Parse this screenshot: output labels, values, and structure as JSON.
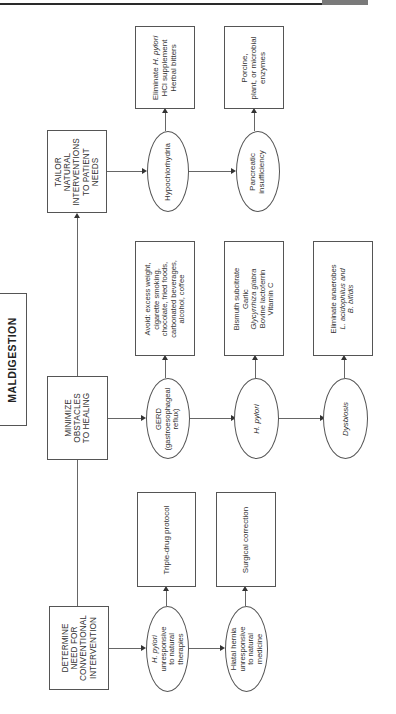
{
  "header": {
    "rule": true
  },
  "title": "MALDIGESTION",
  "steps": [
    {
      "label_lines": [
        "TAILOR",
        "NATURAL",
        "INTERVENTIONS",
        "TO PATIENT",
        "NEEDS"
      ],
      "conditions": [
        {
          "label_lines": [
            "Hypochlorhydria"
          ],
          "treatment_lines": [
            "Eliminate H. pylori",
            "HCl supplement",
            "Herbal bitters"
          ]
        },
        {
          "label_lines": [
            "Pancreatic",
            "insufficiency"
          ],
          "treatment_lines": [
            "Porcine,",
            "plant, or microbial",
            "enzymes"
          ]
        }
      ]
    },
    {
      "label_lines": [
        "MINIMIZE",
        "OBSTACLES",
        "TO HEALING"
      ],
      "conditions": [
        {
          "label_lines": [
            "GERD",
            "(gastroesophageal",
            "reflux)"
          ],
          "treatment_lines": [
            "Avoid: excess weight,",
            "cigarette smoking,",
            "chocolate, fried foods,",
            "carbonated beverages,",
            "alcohol, coffee"
          ]
        },
        {
          "label_lines": [
            "H. pylori"
          ],
          "treatment_lines": [
            "Bismuth subcitrate",
            "Garlic",
            "Glycyrrhiza glabra",
            "Bovine lactoferrin",
            "Vitamin C"
          ]
        },
        {
          "label_lines": [
            "Dysbiosis"
          ],
          "treatment_lines": [
            "Eliminate anaerobes",
            "L. acidophilus and",
            "B. bifidis"
          ]
        }
      ]
    },
    {
      "label_lines": [
        "DETERMINE",
        "NEED FOR",
        "CONVENTIONAL",
        "INTERVENTION"
      ],
      "conditions": [
        {
          "label_lines": [
            "H. pylori",
            "unresponsive",
            "to natural",
            "therapies"
          ],
          "treatment_lines": [
            "Triple-drug protocol"
          ]
        },
        {
          "label_lines": [
            "Hiatal hernia",
            "unresponsive",
            "to natural",
            "medicine"
          ],
          "treatment_lines": [
            "Surgical correction"
          ]
        }
      ]
    }
  ],
  "colors": {
    "line": "#555555",
    "text": "#333333",
    "rule": "#2a2a2a",
    "rule_bar": "#7a7a7a"
  }
}
